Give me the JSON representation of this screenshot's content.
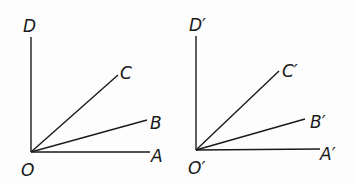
{
  "diagram": {
    "type": "angle-rays",
    "figures": [
      {
        "name": "left",
        "vertex": {
          "label": "O",
          "x": 31,
          "y": 152,
          "label_x": 21,
          "label_y": 176
        },
        "rays": [
          {
            "label": "A",
            "x2": 150,
            "y2": 152,
            "label_x": 151,
            "label_y": 162
          },
          {
            "label": "B",
            "x2": 147,
            "y2": 120,
            "label_x": 150,
            "label_y": 129
          },
          {
            "label": "C",
            "x2": 118,
            "y2": 75,
            "label_x": 120,
            "label_y": 79
          },
          {
            "label": "D",
            "x2": 31,
            "y2": 37,
            "label_x": 23,
            "label_y": 32
          }
        ]
      },
      {
        "name": "right",
        "vertex": {
          "label": "O′",
          "x": 196,
          "y": 150,
          "label_x": 188,
          "label_y": 174
        },
        "rays": [
          {
            "label": "A′",
            "x2": 320,
            "y2": 149,
            "label_x": 320,
            "label_y": 160
          },
          {
            "label": "B′",
            "x2": 305,
            "y2": 119,
            "label_x": 310,
            "label_y": 128
          },
          {
            "label": "C′",
            "x2": 279,
            "y2": 71,
            "label_x": 282,
            "label_y": 77
          },
          {
            "label": "D′",
            "x2": 196,
            "y2": 36,
            "label_x": 189,
            "label_y": 31
          }
        ]
      }
    ],
    "stroke_color": "#1a1a1a",
    "background": "#fdfdfd"
  }
}
